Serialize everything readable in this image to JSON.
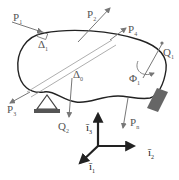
{
  "diagram": {
    "type": "free-body diagram",
    "body_outline_color": "#222222",
    "force_color": "#777777",
    "axis_color": "#222222",
    "support_color": "#555555",
    "labels": {
      "P1": {
        "main": "P",
        "sub": "1"
      },
      "P2": {
        "main": "P",
        "sub": "2"
      },
      "P3": {
        "main": "P",
        "sub": "3"
      },
      "P4": {
        "main": "P",
        "sub": "4"
      },
      "Pn": {
        "main": "P",
        "sub": "n"
      },
      "Q1": {
        "main": "Q",
        "sub": "1"
      },
      "Q2": {
        "main": "Q",
        "sub": "2"
      },
      "Phi1": {
        "main": "Φ",
        "sub": "1"
      },
      "Delta1": {
        "main": "Δ",
        "sub": "1"
      },
      "Delta0": {
        "main": "Δ",
        "sub": "0"
      },
      "i1": {
        "main": "ī",
        "sub": "1"
      },
      "i2": {
        "main": "ī",
        "sub": "2"
      },
      "i3": {
        "main": "ī",
        "sub": "3"
      }
    }
  }
}
